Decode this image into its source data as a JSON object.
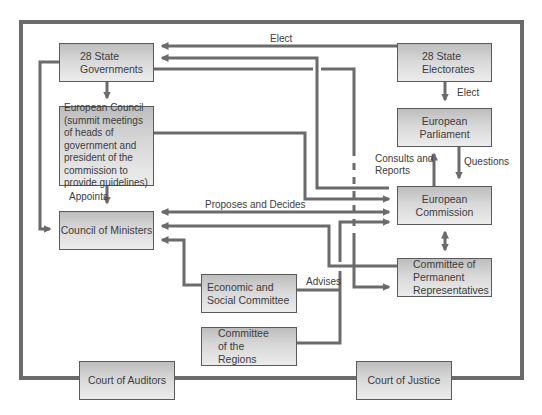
{
  "diagram": {
    "title": "",
    "colors": {
      "line": "#6b6b6b",
      "box_border": "#5a5a5a",
      "box_fill_top": "#bdbdbd",
      "box_fill_bottom": "#ececec",
      "text": "#3c3c3c"
    },
    "nodes": {
      "state_governments": "28 State Governments",
      "state_electorates": "28 State Electorates",
      "european_council": "European Council (summit meetings of heads of government and president of the commission to provide guidelines)",
      "european_parliament": "European Parliament",
      "council_of_ministers": "Council of Ministers",
      "european_commission": "European Commission",
      "coreper": "Committee of Permanent Representatives",
      "economic_social_committee": "Economic and Social Committee",
      "committee_of_regions": "Committee of the Regions",
      "court_of_auditors": "Court of Auditors",
      "court_of_justice": "Court of Justice"
    },
    "edge_labels": {
      "elect_top": "Elect",
      "elect_right": "Elect",
      "appoints": "Appoints",
      "proposes_and_decides": "Proposes and Decides",
      "consults_and_reports": "Consults and Reports",
      "questions": "Questions",
      "advises": "Advises"
    },
    "edges": [
      {
        "from": "28 State Electorates",
        "to": "28 State Governments",
        "label": "Elect"
      },
      {
        "from": "28 State Electorates",
        "to": "European Parliament",
        "label": "Elect"
      },
      {
        "from": "28 State Governments",
        "to": "European Council",
        "label": ""
      },
      {
        "from": "European Council",
        "to": "Council of Ministers",
        "label": "Appoints"
      },
      {
        "from": "28 State Governments",
        "to": "Council of Ministers",
        "label": ""
      },
      {
        "from": "European Commission",
        "to": "28 State Governments",
        "label": ""
      },
      {
        "from": "28 State Governments",
        "to": "Committee of Permanent Representatives",
        "label": ""
      },
      {
        "from": "European Council",
        "to": "European Commission",
        "label": ""
      },
      {
        "from": "Council of Ministers",
        "to": "European Commission",
        "label": "Proposes and Decides",
        "bidirectional": true
      },
      {
        "from": "Committee of Permanent Representatives",
        "to": "Council of Ministers",
        "label": ""
      },
      {
        "from": "Economic and Social Committee",
        "to": "Council of Ministers",
        "label": ""
      },
      {
        "from": "Economic and Social Committee",
        "to": "European Commission",
        "label": "Advises"
      },
      {
        "from": "Committee of the Regions",
        "to": "European Commission",
        "label": "Advises"
      },
      {
        "from": "European Commission",
        "to": "European Parliament",
        "label": "Consults and Reports"
      },
      {
        "from": "European Parliament",
        "to": "European Commission",
        "label": "Questions"
      },
      {
        "from": "European Commission",
        "to": "Committee of Permanent Representatives",
        "label": "",
        "bidirectional": true
      }
    ]
  }
}
